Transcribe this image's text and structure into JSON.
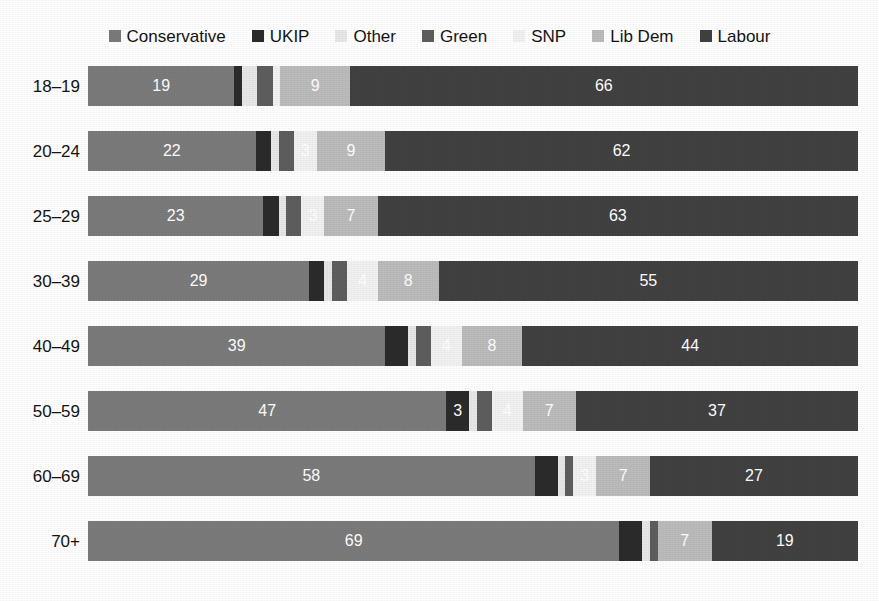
{
  "title_remnant": "",
  "legend": {
    "position": "top-center",
    "items": [
      {
        "label": "Conservative",
        "color": "#7b7b7b",
        "icon": "square-swatch-icon"
      },
      {
        "label": "UKIP",
        "color": "#2b2b2b",
        "icon": "square-swatch-icon"
      },
      {
        "label": "Other",
        "color": "#e8e8e8",
        "icon": "square-swatch-icon"
      },
      {
        "label": "Green",
        "color": "#5e5e5e",
        "icon": "square-swatch-icon"
      },
      {
        "label": "SNP",
        "color": "#f2f2f2",
        "icon": "square-swatch-icon"
      },
      {
        "label": "Lib Dem",
        "color": "#bcbcbc",
        "icon": "square-swatch-icon"
      },
      {
        "label": "Labour",
        "color": "#414141",
        "icon": "square-swatch-icon"
      }
    ]
  },
  "chart_data": {
    "type": "bar",
    "orientation": "horizontal",
    "stacked": true,
    "normalized": true,
    "title": "",
    "xlabel": "",
    "ylabel": "",
    "xlim": [
      0,
      100
    ],
    "grid": false,
    "legend_position": "top-center",
    "categories": [
      "18–19",
      "20–24",
      "25–29",
      "30–39",
      "40–49",
      "50–59",
      "60–69",
      "70+"
    ],
    "series": [
      {
        "name": "Conservative",
        "color": "#7b7b7b",
        "values": [
          19,
          22,
          23,
          29,
          39,
          47,
          58,
          69
        ]
      },
      {
        "name": "UKIP",
        "color": "#2b2b2b",
        "values": [
          1,
          2,
          2,
          2,
          3,
          3,
          3,
          3
        ]
      },
      {
        "name": "Other",
        "color": "#e8e8e8",
        "values": [
          2,
          1,
          1,
          1,
          1,
          1,
          1,
          1
        ]
      },
      {
        "name": "Green",
        "color": "#5e5e5e",
        "values": [
          2,
          2,
          2,
          2,
          2,
          2,
          1,
          1
        ]
      },
      {
        "name": "SNP",
        "color": "#f2f2f2",
        "values": [
          1,
          3,
          3,
          4,
          4,
          4,
          3,
          0
        ]
      },
      {
        "name": "Lib Dem",
        "color": "#bcbcbc",
        "values": [
          9,
          9,
          7,
          8,
          8,
          7,
          7,
          7
        ]
      },
      {
        "name": "Labour",
        "color": "#414141",
        "values": [
          66,
          62,
          63,
          55,
          44,
          37,
          27,
          19
        ]
      }
    ],
    "rows": [
      {
        "category": "18–19",
        "segments": [
          {
            "series": "Conservative",
            "value": 19,
            "label": "19",
            "show_label": true
          },
          {
            "series": "UKIP",
            "value": 1,
            "label": "",
            "show_label": false
          },
          {
            "series": "Other",
            "value": 2,
            "label": "",
            "show_label": false
          },
          {
            "series": "Green",
            "value": 2,
            "label": "",
            "show_label": false
          },
          {
            "series": "SNP",
            "value": 1,
            "label": "",
            "show_label": false
          },
          {
            "series": "Lib Dem",
            "value": 9,
            "label": "9",
            "show_label": true
          },
          {
            "series": "Labour",
            "value": 66,
            "label": "66",
            "show_label": true
          }
        ]
      },
      {
        "category": "20–24",
        "segments": [
          {
            "series": "Conservative",
            "value": 22,
            "label": "22",
            "show_label": true
          },
          {
            "series": "UKIP",
            "value": 2,
            "label": "",
            "show_label": false
          },
          {
            "series": "Other",
            "value": 1,
            "label": "",
            "show_label": false
          },
          {
            "series": "Green",
            "value": 2,
            "label": "",
            "show_label": false
          },
          {
            "series": "SNP",
            "value": 3,
            "label": "3",
            "show_label": true
          },
          {
            "series": "Lib Dem",
            "value": 9,
            "label": "9",
            "show_label": true
          },
          {
            "series": "Labour",
            "value": 62,
            "label": "62",
            "show_label": true
          }
        ]
      },
      {
        "category": "25–29",
        "segments": [
          {
            "series": "Conservative",
            "value": 23,
            "label": "23",
            "show_label": true
          },
          {
            "series": "UKIP",
            "value": 2,
            "label": "",
            "show_label": false
          },
          {
            "series": "Other",
            "value": 1,
            "label": "",
            "show_label": false
          },
          {
            "series": "Green",
            "value": 2,
            "label": "",
            "show_label": false
          },
          {
            "series": "SNP",
            "value": 3,
            "label": "3",
            "show_label": true
          },
          {
            "series": "Lib Dem",
            "value": 7,
            "label": "7",
            "show_label": true
          },
          {
            "series": "Labour",
            "value": 63,
            "label": "63",
            "show_label": true
          }
        ]
      },
      {
        "category": "30–39",
        "segments": [
          {
            "series": "Conservative",
            "value": 29,
            "label": "29",
            "show_label": true
          },
          {
            "series": "UKIP",
            "value": 2,
            "label": "",
            "show_label": false
          },
          {
            "series": "Other",
            "value": 1,
            "label": "",
            "show_label": false
          },
          {
            "series": "Green",
            "value": 2,
            "label": "",
            "show_label": false
          },
          {
            "series": "SNP",
            "value": 4,
            "label": "4",
            "show_label": true
          },
          {
            "series": "Lib Dem",
            "value": 8,
            "label": "8",
            "show_label": true
          },
          {
            "series": "Labour",
            "value": 55,
            "label": "55",
            "show_label": true
          }
        ]
      },
      {
        "category": "40–49",
        "segments": [
          {
            "series": "Conservative",
            "value": 39,
            "label": "39",
            "show_label": true
          },
          {
            "series": "UKIP",
            "value": 3,
            "label": "",
            "show_label": false
          },
          {
            "series": "Other",
            "value": 1,
            "label": "",
            "show_label": false
          },
          {
            "series": "Green",
            "value": 2,
            "label": "",
            "show_label": false
          },
          {
            "series": "SNP",
            "value": 4,
            "label": "4",
            "show_label": true
          },
          {
            "series": "Lib Dem",
            "value": 8,
            "label": "8",
            "show_label": true
          },
          {
            "series": "Labour",
            "value": 44,
            "label": "44",
            "show_label": true
          }
        ]
      },
      {
        "category": "50–59",
        "segments": [
          {
            "series": "Conservative",
            "value": 47,
            "label": "47",
            "show_label": true
          },
          {
            "series": "UKIP",
            "value": 3,
            "label": "3",
            "show_label": true
          },
          {
            "series": "Other",
            "value": 1,
            "label": "",
            "show_label": false
          },
          {
            "series": "Green",
            "value": 2,
            "label": "",
            "show_label": false
          },
          {
            "series": "SNP",
            "value": 4,
            "label": "4",
            "show_label": true
          },
          {
            "series": "Lib Dem",
            "value": 7,
            "label": "7",
            "show_label": true
          },
          {
            "series": "Labour",
            "value": 37,
            "label": "37",
            "show_label": true
          }
        ]
      },
      {
        "category": "60–69",
        "segments": [
          {
            "series": "Conservative",
            "value": 58,
            "label": "58",
            "show_label": true
          },
          {
            "series": "UKIP",
            "value": 3,
            "label": "",
            "show_label": false
          },
          {
            "series": "Other",
            "value": 1,
            "label": "",
            "show_label": false
          },
          {
            "series": "Green",
            "value": 1,
            "label": "",
            "show_label": false
          },
          {
            "series": "SNP",
            "value": 3,
            "label": "3",
            "show_label": true
          },
          {
            "series": "Lib Dem",
            "value": 7,
            "label": "7",
            "show_label": true
          },
          {
            "series": "Labour",
            "value": 27,
            "label": "27",
            "show_label": true
          }
        ]
      },
      {
        "category": "70+",
        "segments": [
          {
            "series": "Conservative",
            "value": 69,
            "label": "69",
            "show_label": true
          },
          {
            "series": "UKIP",
            "value": 3,
            "label": "",
            "show_label": false
          },
          {
            "series": "Other",
            "value": 1,
            "label": "",
            "show_label": false
          },
          {
            "series": "Green",
            "value": 1,
            "label": "",
            "show_label": false
          },
          {
            "series": "SNP",
            "value": 0,
            "label": "",
            "show_label": false
          },
          {
            "series": "Lib Dem",
            "value": 7,
            "label": "7",
            "show_label": true
          },
          {
            "series": "Labour",
            "value": 19,
            "label": "19",
            "show_label": true
          }
        ]
      }
    ]
  }
}
